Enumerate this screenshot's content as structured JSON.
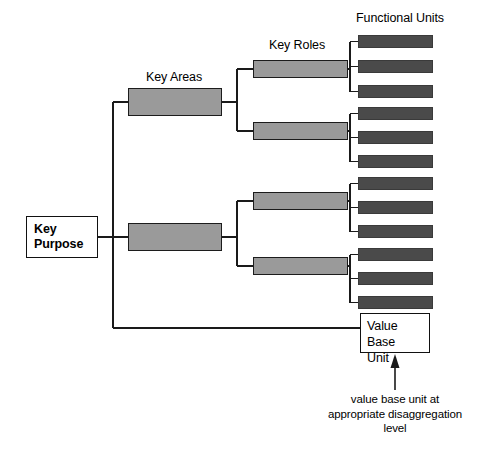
{
  "diagram": {
    "canvas": {
      "width": 497,
      "height": 459,
      "background": "#ffffff"
    },
    "colors": {
      "line": "#1a1a1a",
      "box_white_fill": "#ffffff",
      "box_white_border": "#111111",
      "box_gray_fill": "#9a9a9a",
      "box_gray_border": "#1c1c1c",
      "box_dark_fill": "#4a4a4a",
      "box_dark_border": "#3a3a3a",
      "text": "#000000"
    },
    "tier_labels": [
      {
        "id": "key-areas",
        "text": "Key Areas",
        "x": 146,
        "y": 70
      },
      {
        "id": "key-roles",
        "text": "Key Roles",
        "x": 269,
        "y": 38
      },
      {
        "id": "functional-units",
        "text": "Functional Units",
        "x": 356,
        "y": 11
      }
    ],
    "root": {
      "id": "key-purpose",
      "line1": "Key",
      "line2": "Purpose",
      "text": "Key Purpose",
      "x": 26,
      "y": 216,
      "w": 72,
      "h": 42
    },
    "key_areas": [
      {
        "id": "key-area-1",
        "label": "",
        "x": 128,
        "y": 88,
        "w": 94,
        "h": 28
      },
      {
        "id": "key-area-2",
        "label": "",
        "x": 128,
        "y": 223,
        "w": 94,
        "h": 28
      }
    ],
    "key_roles": [
      {
        "id": "key-role-1",
        "parent": "key-area-1",
        "label": "",
        "x": 253,
        "y": 60,
        "w": 95,
        "h": 18
      },
      {
        "id": "key-role-2",
        "parent": "key-area-1",
        "label": "",
        "x": 253,
        "y": 122,
        "w": 95,
        "h": 18
      },
      {
        "id": "key-role-3",
        "parent": "key-area-2",
        "label": "",
        "x": 253,
        "y": 192,
        "w": 95,
        "h": 18
      },
      {
        "id": "key-role-4",
        "parent": "key-area-2",
        "label": "",
        "x": 253,
        "y": 257,
        "w": 95,
        "h": 18
      }
    ],
    "functional_units": [
      {
        "id": "fu-1",
        "parent": "key-role-1",
        "label": "",
        "x": 358,
        "y": 35,
        "w": 75,
        "h": 13
      },
      {
        "id": "fu-2",
        "parent": "key-role-1",
        "label": "",
        "x": 358,
        "y": 60,
        "w": 75,
        "h": 13
      },
      {
        "id": "fu-3",
        "parent": "key-role-1",
        "label": "",
        "x": 358,
        "y": 85,
        "w": 75,
        "h": 13
      },
      {
        "id": "fu-4",
        "parent": "key-role-2",
        "label": "",
        "x": 358,
        "y": 107,
        "w": 75,
        "h": 13
      },
      {
        "id": "fu-5",
        "parent": "key-role-2",
        "label": "",
        "x": 358,
        "y": 131,
        "w": 75,
        "h": 13
      },
      {
        "id": "fu-6",
        "parent": "key-role-2",
        "label": "",
        "x": 358,
        "y": 155,
        "w": 75,
        "h": 13
      },
      {
        "id": "fu-7",
        "parent": "key-role-3",
        "label": "",
        "x": 358,
        "y": 177,
        "w": 75,
        "h": 13
      },
      {
        "id": "fu-8",
        "parent": "key-role-3",
        "label": "",
        "x": 358,
        "y": 201,
        "w": 75,
        "h": 13
      },
      {
        "id": "fu-9",
        "parent": "key-role-3",
        "label": "",
        "x": 358,
        "y": 225,
        "w": 75,
        "h": 13
      },
      {
        "id": "fu-10",
        "parent": "key-role-4",
        "label": "",
        "x": 358,
        "y": 248,
        "w": 75,
        "h": 13
      },
      {
        "id": "fu-11",
        "parent": "key-role-4",
        "label": "",
        "x": 358,
        "y": 272,
        "w": 75,
        "h": 13
      },
      {
        "id": "fu-12",
        "parent": "key-role-4",
        "label": "",
        "x": 358,
        "y": 296,
        "w": 75,
        "h": 13
      }
    ],
    "value_base_unit": {
      "id": "value-base-unit",
      "line1": "Value Base",
      "line2": "Unit",
      "text": "Value Base Unit",
      "x": 360,
      "y": 313,
      "w": 70,
      "h": 40
    },
    "annotation": {
      "id": "value-base-unit-note",
      "line1": "value base unit at",
      "line2": "appropriate disaggregation",
      "line3": "level",
      "text": "value base unit at appropriate disaggregation level",
      "arrow": {
        "from_x": 395,
        "from_y": 390,
        "to_x": 395,
        "to_y": 356
      }
    }
  }
}
